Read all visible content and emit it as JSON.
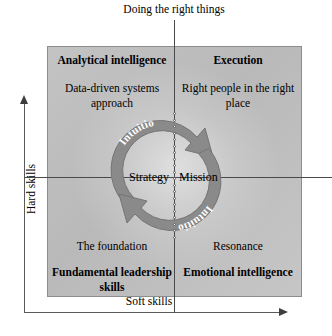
{
  "diagram": {
    "top_caption": "Doing the right things",
    "y_axis_label": "Hard skills",
    "x_axis_label": "Soft skills",
    "center": {
      "left_label": "Strategy",
      "right_label": "Mission"
    },
    "cycle": {
      "arc_label_upper": "Intuition",
      "arc_label_lower": "Intuition",
      "arrow_color": "#8a8a8a",
      "arrow_stroke": "#6f6f6f"
    },
    "quadrants": [
      {
        "id": "top-left",
        "title": "Analytical intelligence",
        "description": "Data-driven systems approach"
      },
      {
        "id": "top-right",
        "title": "Execution",
        "description": "Right people in the right place"
      },
      {
        "id": "bottom-left",
        "title": "Fundamental leadership skills",
        "description": "The foundation"
      },
      {
        "id": "bottom-right",
        "title": "Emotional intelligence",
        "description": "Resonance"
      }
    ],
    "colors": {
      "panel_fill": "#bfbfbf",
      "panel_border": "#8d8d8d",
      "axis": "#5a5a5a",
      "text": "#000000"
    }
  }
}
